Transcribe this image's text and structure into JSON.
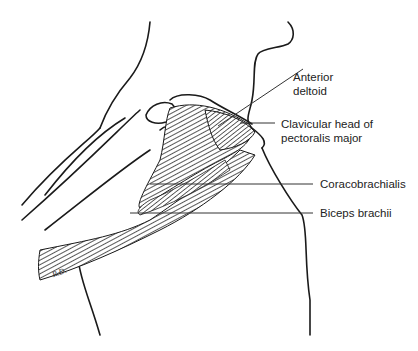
{
  "figure": {
    "signature": "R.D.",
    "labels": [
      {
        "id": "anterior-deltoid",
        "line1": "Anterior",
        "line2": "deltoid"
      },
      {
        "id": "clavicular-head",
        "line1": "Clavicular head of",
        "line2": "pectoralis major"
      },
      {
        "id": "coracobrachialis",
        "line1": "Coracobrachialis",
        "line2": ""
      },
      {
        "id": "biceps-brachii",
        "line1": "Biceps brachii",
        "line2": ""
      }
    ]
  },
  "colors": {
    "outline": "#1a1a1a",
    "muscle": "#3a3a3a",
    "leader": "#333333",
    "background": "#ffffff"
  }
}
